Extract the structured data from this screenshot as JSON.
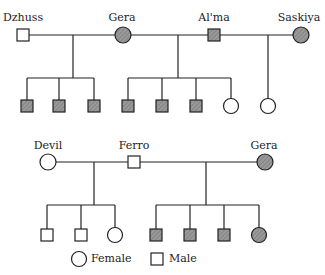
{
  "diagram": {
    "type": "pedigree",
    "colors": {
      "affected": "#8a8a8a",
      "line": "#222222",
      "unaffected": "#ffffff"
    },
    "generation1": {
      "labels": {
        "dzhuss": "Dzhuss",
        "gera": "Gera",
        "alma": "Al'ma",
        "saskiya": "Saskiya"
      },
      "people": [
        {
          "name": "Dzhuss",
          "sex": "male",
          "affected": false
        },
        {
          "name": "Gera",
          "sex": "female",
          "affected": true
        },
        {
          "name": "Al'ma",
          "sex": "male",
          "affected": true
        },
        {
          "name": "Saskiya",
          "sex": "female",
          "affected": true
        }
      ],
      "children": [
        {
          "parents": [
            "Dzhuss",
            "Gera"
          ],
          "offspring": [
            "male-affected",
            "male-affected",
            "male-affected"
          ]
        },
        {
          "parents": [
            "Gera",
            "Al'ma"
          ],
          "offspring": [
            "male-affected",
            "male-affected",
            "male-affected",
            "female-unaffected"
          ]
        },
        {
          "parents": [
            "Al'ma",
            "Saskiya"
          ],
          "offspring": [
            "female-unaffected"
          ]
        }
      ]
    },
    "generation2": {
      "labels": {
        "devil": "Devil",
        "ferro": "Ferro",
        "gera": "Gera"
      },
      "people": [
        {
          "name": "Devil",
          "sex": "female",
          "affected": false
        },
        {
          "name": "Ferro",
          "sex": "male",
          "affected": false
        },
        {
          "name": "Gera",
          "sex": "female",
          "affected": true
        }
      ],
      "children": [
        {
          "parents": [
            "Devil",
            "Ferro"
          ],
          "offspring": [
            "male-unaffected",
            "male-unaffected",
            "female-unaffected"
          ]
        },
        {
          "parents": [
            "Ferro",
            "Gera"
          ],
          "offspring": [
            "male-affected",
            "male-affected",
            "male-affected",
            "female-affected"
          ]
        }
      ]
    },
    "legend": {
      "female": "Female",
      "male": "Male"
    }
  }
}
